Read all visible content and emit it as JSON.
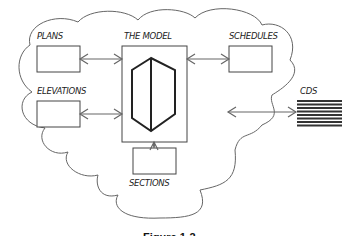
{
  "diagram": {
    "center": {
      "label": "THE MODEL",
      "icon": "building-prism-icon"
    },
    "nodes": [
      {
        "id": "plans",
        "label": "PLANS"
      },
      {
        "id": "elevations",
        "label": "ELEVATIONS"
      },
      {
        "id": "schedules",
        "label": "SCHEDULES"
      },
      {
        "id": "sections",
        "label": "SECTIONS"
      }
    ],
    "external": {
      "label": "CDS",
      "icon": "striped-block-icon"
    },
    "caption": "Figure 1-2",
    "colors": {
      "line": "#555555",
      "ink": "#222222",
      "background": "#ffffff"
    }
  }
}
